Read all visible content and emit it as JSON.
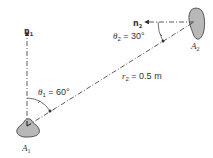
{
  "diagram": {
    "surface1": {
      "label": "A",
      "sub": "1",
      "fill": "#b8b8b8"
    },
    "surface2": {
      "label": "A",
      "sub": "2",
      "fill": "#b8b8b8"
    },
    "normal1": {
      "label": "n",
      "sub": "1"
    },
    "normal2": {
      "label": "n",
      "sub": "2"
    },
    "angle1": {
      "symbol": "θ",
      "sub": "1",
      "value": " = 60°"
    },
    "angle2": {
      "symbol": "θ",
      "sub": "2",
      "value": " = 30°"
    },
    "distance": {
      "symbol": "r",
      "sub": "2",
      "value": " = 0.5 m"
    },
    "line_color": "#333333"
  }
}
